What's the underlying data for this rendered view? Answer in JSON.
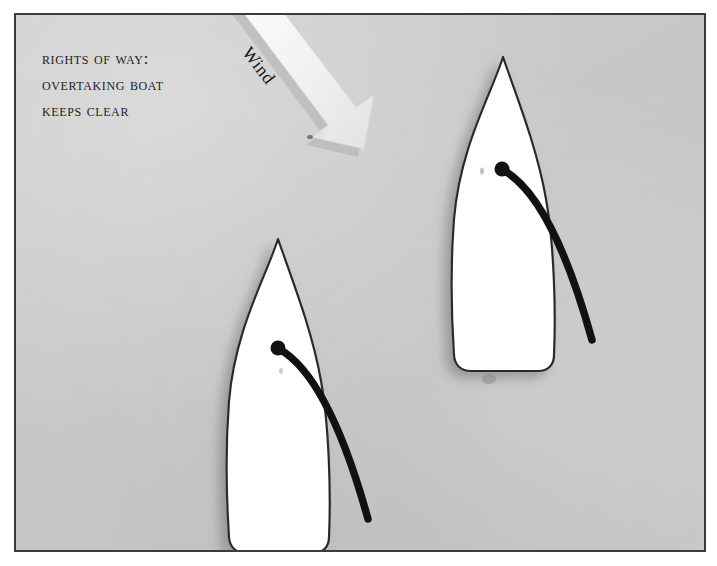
{
  "figure": {
    "kind": "sailing-rights-of-way-diagram",
    "background_color": "#c9c9c9",
    "border_color": "#3c3c3c",
    "page_color": "#ffffff"
  },
  "caption": {
    "line1": "Rights of way:",
    "line2": "Overtaking boat",
    "line3": "keeps clear"
  },
  "wind": {
    "label": "Wind",
    "direction": "from upper-left to lower-right",
    "arrow_color": "#f2f2f2",
    "rotation_degrees": 52
  },
  "boats": [
    {
      "id": "slow-boat",
      "label_line1": "slow",
      "label_line2": "boat",
      "hull_color": "#ffffff",
      "outline_color": "#2b2b2b",
      "boom_color": "#111111",
      "mast_dot": true
    },
    {
      "id": "overtaking-fast-boat",
      "label_line1": "overtaking",
      "label_line2": "fast boat",
      "hull_color": "#ffffff",
      "outline_color": "#2b2b2b",
      "boom_color": "#111111",
      "mast_dot": true
    }
  ]
}
